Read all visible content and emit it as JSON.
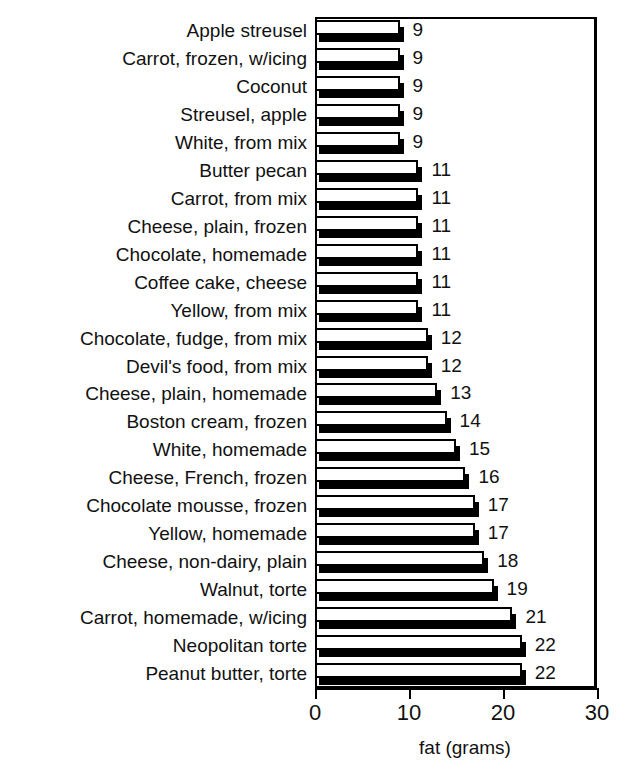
{
  "chart_data": {
    "type": "bar",
    "orientation": "horizontal",
    "title": "",
    "xlabel": "fat (grams)",
    "ylabel": "",
    "xlim": [
      0,
      30
    ],
    "xticks": [
      0,
      10,
      20,
      30
    ],
    "xtick_labels": [
      "0",
      "10",
      "20",
      "30"
    ],
    "grid": false,
    "legend": false,
    "value_labels": true,
    "categories": [
      "Apple streusel",
      "Carrot, frozen, w/icing",
      "Coconut",
      "Streusel, apple",
      "White, from mix",
      "Butter pecan",
      "Carrot, from mix",
      "Cheese, plain, frozen",
      "Chocolate, homemade",
      "Coffee cake, cheese",
      "Yellow, from mix",
      "Chocolate, fudge, from mix",
      "Devil's food, from mix",
      "Cheese, plain, homemade",
      "Boston cream, frozen",
      "White, homemade",
      "Cheese, French, frozen",
      "Chocolate mousse, frozen",
      "Yellow, homemade",
      "Cheese, non-dairy, plain",
      "Walnut, torte",
      "Carrot, homemade, w/icing",
      "Neopolitan torte",
      "Peanut butter, torte"
    ],
    "values": [
      9,
      9,
      9,
      9,
      9,
      11,
      11,
      11,
      11,
      11,
      11,
      12,
      12,
      13,
      14,
      15,
      16,
      17,
      17,
      18,
      19,
      21,
      22,
      22
    ],
    "value_strings": [
      "9",
      "9",
      "9",
      "9",
      "9",
      "11",
      "11",
      "11",
      "11",
      "11",
      "11",
      "12",
      "12",
      "13",
      "14",
      "15",
      "16",
      "17",
      "17",
      "18",
      "19",
      "21",
      "22",
      "22"
    ]
  },
  "style": {
    "bar_face_color": "#ffffff",
    "bar_edge_color": "#000000",
    "bar_shadow_color": "#000000",
    "axis_color": "#000000",
    "text_color": "#111111",
    "background": "#ffffff"
  }
}
